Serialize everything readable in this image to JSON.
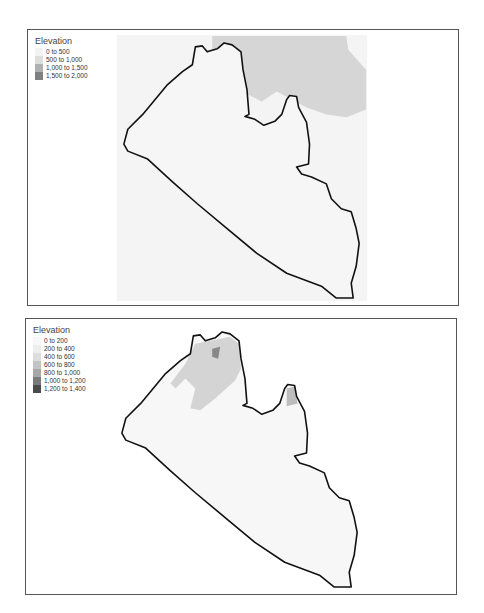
{
  "maps": [
    {
      "legend": {
        "title": "Elevation",
        "items": [
          {
            "label": "0 to 500",
            "color": "#f2f2f2"
          },
          {
            "label": "500 to 1,000",
            "color": "#dddddd"
          },
          {
            "label": "1,000 to 1,500",
            "color": "#b0b0b0"
          },
          {
            "label": "1,500 to 2,000",
            "color": "#808080"
          }
        ]
      }
    },
    {
      "legend": {
        "title": "Elevation",
        "items": [
          {
            "label": "0 to 200",
            "color": "#f7f7f7"
          },
          {
            "label": "200 to 400",
            "color": "#eeeeee"
          },
          {
            "label": "400 to 600",
            "color": "#dddddd"
          },
          {
            "label": "600 to 800",
            "color": "#c4c4c4"
          },
          {
            "label": "800 to 1,000",
            "color": "#a8a8a8"
          },
          {
            "label": "1,000 to 1,200",
            "color": "#7a7a7a"
          },
          {
            "label": "1,200 to 1,400",
            "color": "#4a4a4a"
          }
        ]
      }
    }
  ]
}
